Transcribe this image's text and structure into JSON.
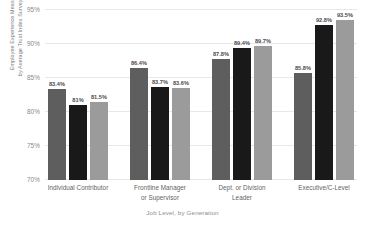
{
  "chart_data": {
    "type": "bar",
    "title": "",
    "subtitle": "",
    "xlabel": "Job Level, by Generation",
    "ylabel_line1": "Employee Experience Measured",
    "ylabel_line2": "by Average Trust Index Survey Score",
    "ylim": [
      70,
      95
    ],
    "yticks": [
      "70%",
      "75%",
      "80%",
      "85%",
      "90%",
      "95%"
    ],
    "ytick_values": [
      70,
      75,
      80,
      85,
      90,
      95
    ],
    "grid": true,
    "legend": "none",
    "categories": [
      {
        "line1": "Individual Contributor",
        "line2": ""
      },
      {
        "line1": "Frontline Manager",
        "line2": "or Supervisor"
      },
      {
        "line1": "Dept. or Division",
        "line2": "Leader"
      },
      {
        "line1": "Executive/C-Level",
        "line2": ""
      }
    ],
    "series": [
      {
        "name": "series-1",
        "color": "#5e5e5e",
        "values": [
          83.4,
          86.4,
          87.8,
          85.8
        ],
        "labels": [
          "83.4%",
          "86.4%",
          "87.8%",
          "85.8%"
        ]
      },
      {
        "name": "series-2",
        "color": "#191919",
        "values": [
          81.0,
          83.7,
          89.4,
          92.8
        ],
        "labels": [
          "81%",
          "83.7%",
          "89.4%",
          "92.8%"
        ]
      },
      {
        "name": "series-3",
        "color": "#9b9b9b",
        "values": [
          81.5,
          83.6,
          89.7,
          93.5
        ],
        "labels": [
          "81.5%",
          "83.6%",
          "89.7%",
          "93.5%"
        ]
      }
    ]
  }
}
